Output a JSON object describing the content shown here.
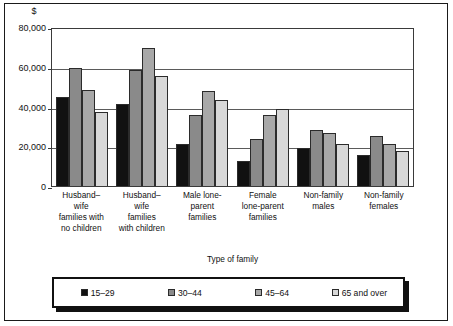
{
  "chart_data": {
    "type": "bar",
    "title": "",
    "unit_label": "$",
    "xlabel": "Type of family",
    "ylabel": "",
    "ylim": [
      0,
      80000
    ],
    "yticks": [
      0,
      20000,
      40000,
      60000,
      80000
    ],
    "ytick_labels": [
      "0",
      "20,000",
      "40,000",
      "60,000",
      "80,000"
    ],
    "grid": true,
    "legend_position": "bottom",
    "categories": [
      "Husband–wife families with no children",
      "Husband–wife families with children",
      "Male lone-parent families",
      "Female lone-parent families",
      "Non-family males",
      "Non-family females"
    ],
    "category_lines": [
      [
        "Husband–",
        "wife",
        "families with",
        "no children"
      ],
      [
        "Husband–",
        "wife",
        "families",
        "with children"
      ],
      [
        "Male lone-",
        "parent",
        "families"
      ],
      [
        "Female",
        "lone-parent",
        "families"
      ],
      [
        "Non-family",
        "males"
      ],
      [
        "Non-family",
        "females"
      ]
    ],
    "series": [
      {
        "name": "15–29",
        "color": "#111111",
        "values": [
          45000,
          41500,
          21000,
          12700,
          19000,
          15500
        ]
      },
      {
        "name": "30–44",
        "color": "#8a8a8a",
        "values": [
          59500,
          58500,
          35500,
          23400,
          28000,
          25200
        ]
      },
      {
        "name": "45–64",
        "color": "#a8a8a8",
        "values": [
          48500,
          69500,
          48000,
          35500,
          26500,
          21200
        ]
      },
      {
        "name": "65 and over",
        "color": "#d8d8d8",
        "values": [
          37000,
          55500,
          43500,
          38500,
          21000,
          17500
        ]
      }
    ]
  }
}
